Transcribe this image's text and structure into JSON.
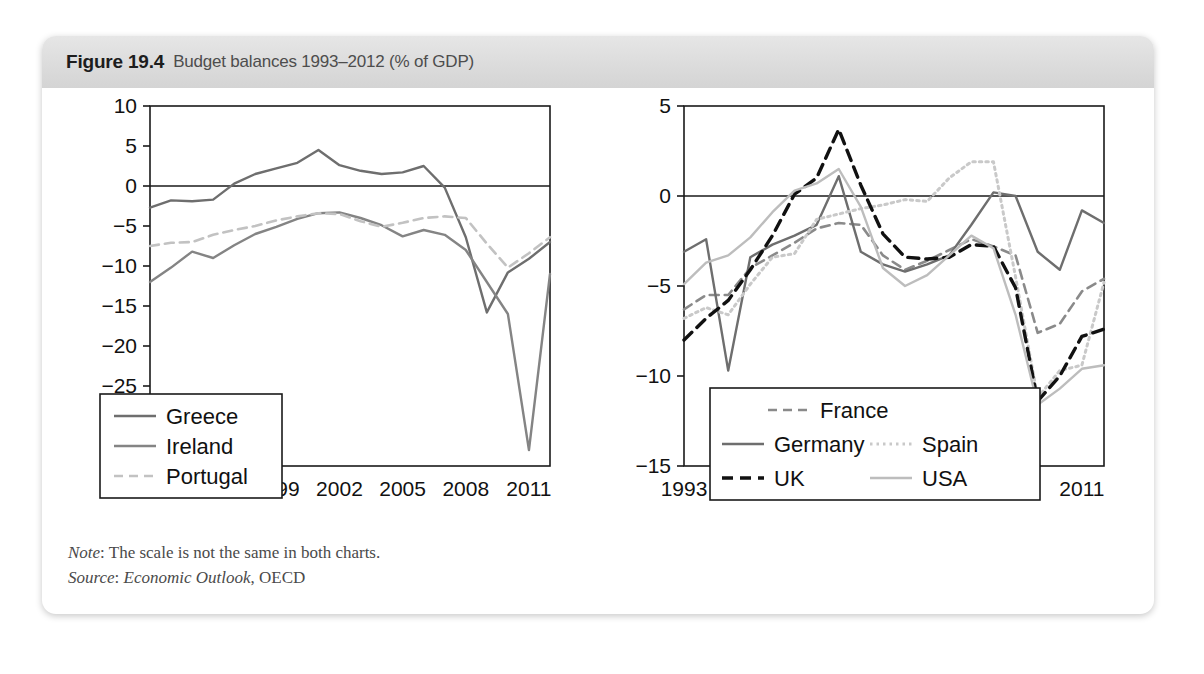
{
  "figure": {
    "number": "Figure 19.4",
    "title": "Budget balances 1993–2012 (% of GDP)"
  },
  "notes": {
    "note_label": "Note",
    "note_text": ": The scale is not the same in both charts.",
    "source_label": "Source",
    "source_text": ": ",
    "source_italic": "Economic Outlook",
    "source_rest": ", OECD"
  },
  "colors": {
    "greece": "#6e6e6e",
    "ireland": "#848484",
    "portugal": "#c2c2c2",
    "france": "#8a8a8a",
    "germany": "#6e6e6e",
    "spain": "#c9c9c9",
    "uk": "#111111",
    "usa": "#bdbdbd",
    "axis": "#1a1a1a",
    "frame": "#1a1a1a",
    "header_bg": "#dcdcdc",
    "page_bg": "#ffffff"
  },
  "chart_data": [
    {
      "id": "left",
      "type": "line",
      "title": "",
      "xlabel": "",
      "ylabel": "",
      "xlim": [
        1993,
        2012
      ],
      "ylim": [
        -35,
        10
      ],
      "yticks": [
        10,
        5,
        0,
        -5,
        -10,
        -15,
        -20,
        -25,
        -30,
        -35
      ],
      "ytick_labels": [
        "10",
        "5",
        "0",
        "−5",
        "−10",
        "−15",
        "−20",
        "−25",
        "−30",
        "−35"
      ],
      "xticks": [
        1993,
        1996,
        1999,
        2002,
        2005,
        2008,
        2011
      ],
      "xtick_labels": [
        "1993",
        "1996",
        "1999",
        "2002",
        "2005",
        "2008",
        "2011"
      ],
      "grid": false,
      "zero_line": true,
      "legend_position": "bottom-left",
      "x": [
        1993,
        1994,
        1995,
        1996,
        1997,
        1998,
        1999,
        2000,
        2001,
        2002,
        2003,
        2004,
        2005,
        2006,
        2007,
        2008,
        2009,
        2010,
        2011,
        2012
      ],
      "series": [
        {
          "name": "Greece",
          "style": "solid",
          "color": "#6e6e6e",
          "values": [
            -2.7,
            -1.8,
            -1.9,
            -1.7,
            0.3,
            1.5,
            2.2,
            2.9,
            4.5,
            2.6,
            1.9,
            1.5,
            1.7,
            2.5,
            -0.2,
            -6.4,
            -15.8,
            -10.8,
            -9.1,
            -7.0
          ]
        },
        {
          "name": "Ireland",
          "style": "solid",
          "color": "#848484",
          "values": [
            -12.0,
            -10.2,
            -8.2,
            -9.0,
            -7.4,
            -6.0,
            -5.1,
            -4.1,
            -3.4,
            -3.3,
            -4.0,
            -4.9,
            -6.3,
            -5.5,
            -6.1,
            -8.0,
            -12.0,
            -16.0,
            -33.0,
            -11.0
          ]
        },
        {
          "name": "Portugal",
          "style": "dashed",
          "color": "#c2c2c2",
          "values": [
            -7.5,
            -7.1,
            -7.0,
            -6.1,
            -5.5,
            -5.0,
            -4.3,
            -3.8,
            -3.4,
            -3.5,
            -4.4,
            -5.1,
            -4.6,
            -4.0,
            -3.8,
            -4.0,
            -7.2,
            -10.2,
            -8.4,
            -6.4
          ]
        }
      ]
    },
    {
      "id": "right",
      "type": "line",
      "title": "",
      "xlabel": "",
      "ylabel": "",
      "xlim": [
        1993,
        2012
      ],
      "ylim": [
        -15,
        5
      ],
      "yticks": [
        5,
        0,
        -5,
        -10,
        -15
      ],
      "ytick_labels": [
        "5",
        "0",
        "−5",
        "−10",
        "−15"
      ],
      "xticks": [
        1993,
        1996,
        1999,
        2002,
        2005,
        2008,
        2011
      ],
      "xtick_labels": [
        "1993",
        "1996",
        "1999",
        "2002",
        "2005",
        "2008",
        "2011"
      ],
      "grid": false,
      "zero_line": true,
      "legend_position": "bottom-center",
      "x": [
        1993,
        1994,
        1995,
        1996,
        1997,
        1998,
        1999,
        2000,
        2001,
        2002,
        2003,
        2004,
        2005,
        2006,
        2007,
        2008,
        2009,
        2010,
        2011,
        2012
      ],
      "series": [
        {
          "name": "France",
          "style": "dashed",
          "color": "#8a8a8a",
          "values": [
            -6.3,
            -5.5,
            -5.5,
            -4.0,
            -3.3,
            -2.6,
            -1.8,
            -1.5,
            -1.6,
            -3.3,
            -4.1,
            -3.6,
            -3.0,
            -2.4,
            -2.8,
            -3.3,
            -7.6,
            -7.1,
            -5.3,
            -4.6
          ]
        },
        {
          "name": "Germany",
          "style": "solid",
          "color": "#6e6e6e",
          "values": [
            -3.1,
            -2.4,
            -9.7,
            -3.4,
            -2.7,
            -2.2,
            -1.6,
            1.1,
            -3.1,
            -3.8,
            -4.2,
            -3.8,
            -3.3,
            -1.6,
            0.2,
            0.0,
            -3.1,
            -4.1,
            -0.8,
            -1.5
          ]
        },
        {
          "name": "Spain",
          "style": "dotted",
          "color": "#c9c9c9",
          "values": [
            -6.8,
            -6.2,
            -6.6,
            -4.9,
            -3.4,
            -3.2,
            -1.3,
            -1.0,
            -0.7,
            -0.5,
            -0.2,
            -0.3,
            1.0,
            1.9,
            1.9,
            -4.5,
            -11.2,
            -9.7,
            -9.4,
            -4.8
          ]
        },
        {
          "name": "UK",
          "style": "dashed-bold",
          "color": "#111111",
          "values": [
            -8.0,
            -6.8,
            -5.8,
            -4.1,
            -2.2,
            0.1,
            1.0,
            3.7,
            0.6,
            -2.1,
            -3.4,
            -3.5,
            -3.4,
            -2.7,
            -2.8,
            -5.1,
            -11.4,
            -10.0,
            -7.8,
            -7.4
          ]
        },
        {
          "name": "USA",
          "style": "solid",
          "color": "#bdbdbd",
          "values": [
            -4.9,
            -3.7,
            -3.3,
            -2.3,
            -0.9,
            0.3,
            0.7,
            1.5,
            -0.6,
            -4.0,
            -5.0,
            -4.4,
            -3.3,
            -2.2,
            -2.9,
            -6.6,
            -11.6,
            -10.7,
            -9.6,
            -9.4
          ]
        }
      ]
    }
  ],
  "legends": {
    "left": {
      "items": [
        {
          "label": "Greece",
          "style": "solid",
          "color": "#6e6e6e"
        },
        {
          "label": "Ireland",
          "style": "solid",
          "color": "#848484"
        },
        {
          "label": "Portugal",
          "style": "dashed",
          "color": "#c2c2c2"
        }
      ]
    },
    "right": {
      "items": [
        {
          "label": "France",
          "style": "dashed",
          "color": "#8a8a8a"
        },
        {
          "label": "Germany",
          "style": "solid",
          "color": "#6e6e6e"
        },
        {
          "label": "Spain",
          "style": "dotted",
          "color": "#c9c9c9"
        },
        {
          "label": "UK",
          "style": "dashed-bold",
          "color": "#111111"
        },
        {
          "label": "USA",
          "style": "solid",
          "color": "#bdbdbd"
        }
      ]
    }
  }
}
